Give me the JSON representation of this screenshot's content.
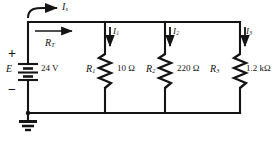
{
  "diagram": {
    "type": "schematic",
    "stroke_color": "#141414",
    "background_color": "#ffffff"
  },
  "source": {
    "symbol_name": "battery-symbol",
    "designator": "E",
    "value": "24 V",
    "polarity_positive": "+",
    "polarity_negative": "−"
  },
  "ground": {
    "symbol_name": "earth-ground-symbol",
    "label": ""
  },
  "currents": {
    "supply": {
      "name": "Is",
      "label": "I",
      "subscript": "s"
    },
    "branch1": {
      "name": "I1",
      "label": "I",
      "subscript": "1"
    },
    "branch2": {
      "name": "I2",
      "label": "I",
      "subscript": "2"
    },
    "branch3": {
      "name": "I3",
      "label": "I",
      "subscript": "3"
    }
  },
  "total_resistance": {
    "label": "R",
    "subscript": "T"
  },
  "resistors": [
    {
      "designator": "R",
      "subscript": "1",
      "value": "10 Ω"
    },
    {
      "designator": "R",
      "subscript": "2",
      "value": "220 Ω"
    },
    {
      "designator": "R",
      "subscript": "3",
      "value": "1.2 kΩ"
    }
  ]
}
